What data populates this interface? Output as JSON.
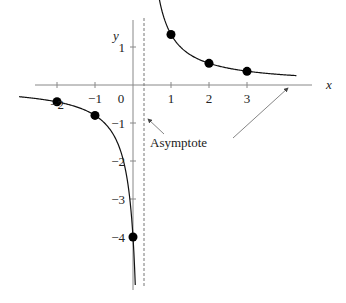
{
  "chart_data": {
    "type": "line",
    "title": "",
    "xlabel": "x",
    "ylabel": "y",
    "function_description": "y ≈ 1/(x − 0.25)",
    "vertical_asymptote_x": 0.25,
    "horizontal_asymptote_y": 0,
    "xlim": [
      -3.4,
      4.8
    ],
    "ylim": [
      -5.3,
      2.2
    ],
    "x_ticks": [
      {
        "value": -2,
        "label": "−2"
      },
      {
        "value": -1,
        "label": "−1"
      },
      {
        "value": 1,
        "label": "1"
      },
      {
        "value": 2,
        "label": "2"
      },
      {
        "value": 3,
        "label": "3"
      }
    ],
    "origin_label": "0",
    "y_ticks": [
      {
        "value": 1,
        "label": "1"
      },
      {
        "value": -1,
        "label": "−1"
      },
      {
        "value": -2,
        "label": "−2"
      },
      {
        "value": -3,
        "label": "−3"
      },
      {
        "value": -4,
        "label": "−4"
      }
    ],
    "points": [
      {
        "x": -2,
        "y": -0.44
      },
      {
        "x": -1,
        "y": -0.8
      },
      {
        "x": 0,
        "y": -4
      },
      {
        "x": 1,
        "y": 1.33
      },
      {
        "x": 2,
        "y": 0.57
      },
      {
        "x": 3,
        "y": 0.36
      }
    ],
    "annotations": [
      {
        "text": "Asymptote",
        "targets": [
          "vertical-asymptote",
          "horizontal-asymptote"
        ]
      }
    ],
    "grid": false,
    "legend": "none"
  }
}
